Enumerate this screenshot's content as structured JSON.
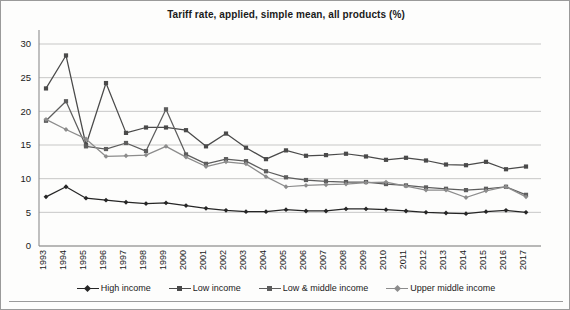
{
  "chart_data": {
    "type": "line",
    "title": "Tariff rate, applied, simple mean, all products (%)",
    "xlabel": "",
    "ylabel": "",
    "ylim": [
      0,
      30
    ],
    "yticks": [
      0,
      5,
      10,
      15,
      20,
      25,
      30
    ],
    "grid": true,
    "legend_position": "bottom",
    "categories": [
      "1993",
      "1994",
      "1995",
      "1996",
      "1997",
      "1998",
      "1999",
      "2000",
      "2001",
      "2002",
      "2003",
      "2004",
      "2005",
      "2006",
      "2007",
      "2008",
      "2009",
      "2010",
      "2011",
      "2012",
      "2013",
      "2014",
      "2015",
      "2016",
      "2017"
    ],
    "series": [
      {
        "name": "High income",
        "color": "#262626",
        "marker": "diamond",
        "values": [
          7.3,
          8.8,
          7.1,
          6.8,
          6.5,
          6.3,
          6.4,
          6.0,
          5.6,
          5.3,
          5.1,
          5.1,
          5.4,
          5.2,
          5.2,
          5.5,
          5.5,
          5.4,
          5.2,
          5.0,
          4.9,
          4.8,
          5.1,
          5.3,
          5.0
        ]
      },
      {
        "name": "Low income",
        "color": "#4a4a4a",
        "marker": "square",
        "values": [
          23.4,
          28.3,
          15.0,
          24.2,
          16.8,
          17.6,
          17.6,
          17.2,
          14.8,
          16.7,
          14.6,
          12.9,
          14.2,
          13.4,
          13.5,
          13.7,
          13.3,
          12.8,
          13.1,
          12.7,
          12.1,
          12.0,
          12.5,
          11.4,
          11.8
        ]
      },
      {
        "name": "Low & middle income",
        "color": "#5d5d5d",
        "marker": "square",
        "values": [
          18.6,
          21.5,
          14.8,
          14.4,
          15.3,
          14.1,
          20.3,
          13.6,
          12.2,
          12.9,
          12.6,
          11.1,
          10.2,
          9.8,
          9.6,
          9.5,
          9.5,
          9.2,
          9.0,
          8.7,
          8.5,
          8.3,
          8.5,
          8.8,
          7.6
        ]
      },
      {
        "name": "Upper middle income",
        "color": "#8c8c8c",
        "marker": "diamond",
        "values": [
          18.8,
          17.3,
          15.9,
          13.3,
          13.4,
          13.5,
          14.8,
          13.2,
          11.8,
          12.5,
          12.2,
          10.3,
          8.8,
          9.0,
          9.1,
          9.2,
          9.4,
          9.5,
          8.9,
          8.3,
          8.3,
          7.2,
          8.2,
          8.8,
          7.3
        ]
      }
    ]
  },
  "legend": {
    "items": [
      {
        "label": "High income"
      },
      {
        "label": "Low income"
      },
      {
        "label": "Low & middle income"
      },
      {
        "label": "Upper middle income"
      }
    ]
  }
}
